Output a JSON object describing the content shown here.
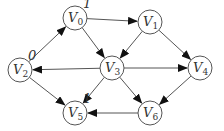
{
  "diagram": {
    "type": "directed-graph",
    "nodes": [
      {
        "id": "V0",
        "name": "V",
        "sub": "0",
        "x": 75,
        "y": 18,
        "label": "1"
      },
      {
        "id": "V1",
        "name": "V",
        "sub": "1",
        "x": 150,
        "y": 22,
        "label": ""
      },
      {
        "id": "V2",
        "name": "V",
        "sub": "2",
        "x": 20,
        "y": 70,
        "label": "0"
      },
      {
        "id": "V3",
        "name": "V",
        "sub": "3",
        "x": 112,
        "y": 68,
        "label": ""
      },
      {
        "id": "V4",
        "name": "V",
        "sub": "4",
        "x": 200,
        "y": 68,
        "label": ""
      },
      {
        "id": "V5",
        "name": "V",
        "sub": "5",
        "x": 75,
        "y": 113,
        "label": "1"
      },
      {
        "id": "V6",
        "name": "V",
        "sub": "6",
        "x": 150,
        "y": 113,
        "label": ""
      }
    ],
    "edges": [
      {
        "from": "V0",
        "to": "V1"
      },
      {
        "from": "V0",
        "to": "V3"
      },
      {
        "from": "V2",
        "to": "V0"
      },
      {
        "from": "V1",
        "to": "V3"
      },
      {
        "from": "V1",
        "to": "V4"
      },
      {
        "from": "V3",
        "to": "V2"
      },
      {
        "from": "V3",
        "to": "V4"
      },
      {
        "from": "V3",
        "to": "V5"
      },
      {
        "from": "V3",
        "to": "V6"
      },
      {
        "from": "V2",
        "to": "V5"
      },
      {
        "from": "V4",
        "to": "V6"
      },
      {
        "from": "V6",
        "to": "V5"
      }
    ]
  }
}
